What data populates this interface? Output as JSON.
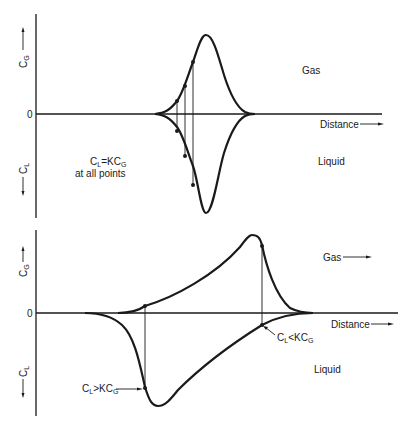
{
  "top_panel": {
    "y_axis_top_label": "C",
    "y_axis_top_sub": "G",
    "y_axis_bottom_label": "C",
    "y_axis_bottom_sub": "L",
    "zero_label": "0",
    "x_axis_label": "Distance",
    "gas_label": "Gas",
    "liquid_label": "Liquid",
    "annotation_line1_main": "C",
    "annotation_line1_sub": "L",
    "annotation_line1_mid": "=KC",
    "annotation_line1_sub2": "G",
    "annotation_line2": "at all points"
  },
  "bottom_panel": {
    "y_axis_top_label": "C",
    "y_axis_top_sub": "G",
    "y_axis_bottom_label": "C",
    "y_axis_bottom_sub": "L",
    "zero_label": "0",
    "x_axis_label": "Distance",
    "gas_label": "Gas",
    "liquid_label": "Liquid",
    "annotation_greater_main": "C",
    "annotation_greater_sub": "L",
    "annotation_greater_mid": ">KC",
    "annotation_greater_sub2": "G",
    "annotation_less_main": "C",
    "annotation_less_sub": "L",
    "annotation_less_mid": "<KC",
    "annotation_less_sub2": "G"
  },
  "colors": {
    "ink": "#1a1a1a",
    "background": "#ffffff"
  }
}
